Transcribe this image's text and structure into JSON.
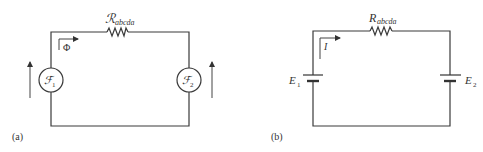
{
  "diagram": {
    "type": "circuit-analogy",
    "panels": [
      {
        "id": "a",
        "caption": "(a)",
        "kind": "magnetic circuit",
        "resistor_label": "ℛ",
        "resistor_subscript": "abcda",
        "flow_label": "Φ",
        "sources": [
          {
            "symbol": "ℱ",
            "subscript": "1"
          },
          {
            "symbol": "ℱ",
            "subscript": "2"
          }
        ]
      },
      {
        "id": "b",
        "caption": "(b)",
        "kind": "electric circuit",
        "resistor_label": "R",
        "resistor_subscript": "abcda",
        "flow_label": "I",
        "sources": [
          {
            "symbol": "E",
            "subscript": "1"
          },
          {
            "symbol": "E",
            "subscript": "2"
          }
        ]
      }
    ]
  }
}
